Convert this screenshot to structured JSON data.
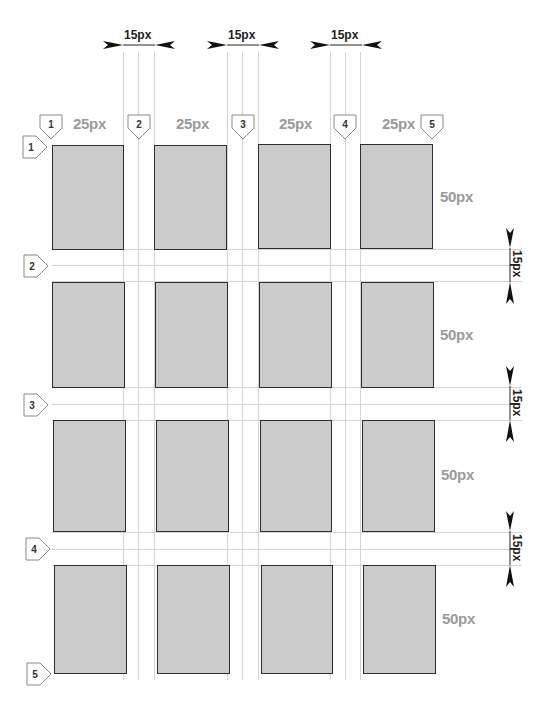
{
  "diagram": {
    "column_markers": [
      "1",
      "2",
      "3",
      "4",
      "5"
    ],
    "row_markers": [
      "1",
      "2",
      "3",
      "4",
      "5"
    ],
    "column_width_labels": [
      "25px",
      "25px",
      "25px",
      "25px"
    ],
    "row_height_labels": [
      "50px",
      "50px",
      "50px",
      "50px"
    ],
    "column_gutter_labels": [
      "15px",
      "15px",
      "15px"
    ],
    "row_gutter_labels": [
      "15px",
      "15px",
      "15px"
    ],
    "columns": 4,
    "rows": 4,
    "colors": {
      "cell_fill": "#cbcbcb",
      "cell_border": "#2e2e2e",
      "guide_line": "#d4d4d4",
      "size_label": "#9a9a9a",
      "dimension_label": "#222222"
    }
  }
}
